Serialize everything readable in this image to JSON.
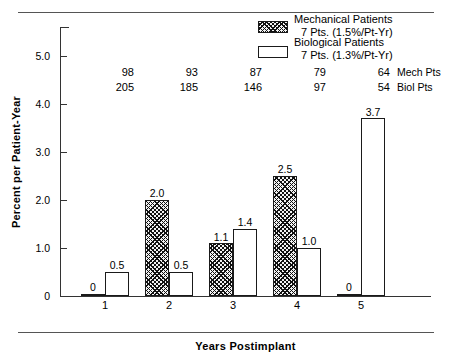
{
  "chart_data": {
    "type": "bar",
    "title": "",
    "xlabel": "Years Postimplant",
    "ylabel": "Percent per Patient-Year",
    "categories": [
      "1",
      "2",
      "3",
      "4",
      "5"
    ],
    "ylim": [
      0,
      5.6
    ],
    "yticks": [
      "0",
      "1.0",
      "2.0",
      "3.0",
      "4.0",
      "5.0"
    ],
    "ytick_values": [
      0,
      1.0,
      2.0,
      3.0,
      4.0,
      5.0
    ],
    "grid": false,
    "legend_position": "top-right",
    "series": [
      {
        "name": "Mechanical Patients",
        "values": [
          0,
          2.0,
          1.1,
          2.5,
          0
        ],
        "labels": [
          "0",
          "2.0",
          "1.1",
          "2.5",
          "0"
        ],
        "fill": "hatched"
      },
      {
        "name": "Biological Patients",
        "values": [
          0.5,
          0.5,
          1.4,
          1.0,
          3.7
        ],
        "labels": [
          "0.5",
          "0.5",
          "1.4",
          "1.0",
          "3.7"
        ],
        "fill": "open"
      }
    ],
    "annotations": {
      "mech_patient_counts": [
        "98",
        "93",
        "87",
        "79",
        "64"
      ],
      "biol_patient_counts": [
        "205",
        "185",
        "146",
        "97",
        "54"
      ],
      "mech_counts_label": "Mech Pts",
      "biol_counts_label": "Biol Pts"
    }
  },
  "legend": {
    "mechanical": {
      "title": "Mechanical Patients",
      "detail": "7 Pts. (1.5%/Pt-Yr)"
    },
    "biological": {
      "title": "Biological Patients",
      "detail": "7 Pts. (1.3%/Pt-Yr)"
    }
  },
  "colors": {
    "axis": "#333333",
    "bar_outline": "#1a1a1a",
    "hatch": "#111111",
    "background": "#ffffff"
  }
}
